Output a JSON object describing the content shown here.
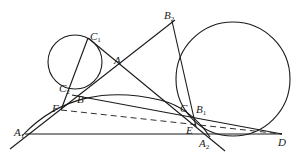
{
  "diagram": {
    "type": "geometry",
    "stroke_color": "#1a1a1a",
    "circles": [
      {
        "name": "small-circle",
        "cx": 75,
        "cy": 62,
        "r": 27
      },
      {
        "name": "large-circle",
        "cx": 233,
        "cy": 79,
        "r": 57
      }
    ],
    "points": {
      "C1": {
        "label": "C",
        "sub": "1",
        "x": 90,
        "y": 31
      },
      "A": {
        "label": "A",
        "sub": "",
        "x": 114,
        "y": 55
      },
      "B2": {
        "label": "B",
        "sub": "2",
        "x": 164,
        "y": 11
      },
      "C2": {
        "label": "C",
        "sub": "2",
        "x": 59,
        "y": 83
      },
      "B": {
        "label": "B",
        "sub": "",
        "x": 78,
        "y": 95
      },
      "F": {
        "label": "F",
        "sub": "",
        "x": 52,
        "y": 104
      },
      "A1": {
        "label": "A",
        "sub": "1",
        "x": 14,
        "y": 128
      },
      "C": {
        "label": "C",
        "sub": "",
        "x": 180,
        "y": 103
      },
      "B1": {
        "label": "B",
        "sub": "1",
        "x": 196,
        "y": 104
      },
      "E": {
        "label": "E",
        "sub": "",
        "x": 186,
        "y": 127
      },
      "A2": {
        "label": "A",
        "sub": "2",
        "x": 199,
        "y": 138
      },
      "D": {
        "label": "D",
        "sub": "",
        "x": 278,
        "y": 138
      }
    }
  }
}
